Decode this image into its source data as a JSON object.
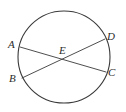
{
  "figure": {
    "type": "geometry-diagram",
    "background_color": "#ffffff",
    "stroke_color": "#3a3a3a",
    "label_color": "#2b2b2b",
    "canvas": {
      "width": 126,
      "height": 112
    },
    "circle": {
      "name": "circle",
      "cx": 64,
      "cy": 57,
      "r": 46,
      "stroke_width": 1.1
    },
    "chords": [
      {
        "name": "chord-a-c",
        "from": "A",
        "to": "C",
        "x1": 20,
        "y1": 47,
        "x2": 106,
        "y2": 72,
        "stroke_width": 0.9
      },
      {
        "name": "chord-b-d",
        "from": "B",
        "to": "D",
        "x1": 22,
        "y1": 78,
        "x2": 105,
        "y2": 39,
        "stroke_width": 0.9
      }
    ],
    "points": [
      {
        "id": "A",
        "label": "A",
        "x": 20,
        "y": 47,
        "position": "left-upper",
        "on_circle": true
      },
      {
        "id": "B",
        "label": "B",
        "x": 22,
        "y": 78,
        "position": "left-lower",
        "on_circle": true
      },
      {
        "id": "C",
        "label": "C",
        "x": 106,
        "y": 72,
        "position": "right-lower",
        "on_circle": true
      },
      {
        "id": "D",
        "label": "D",
        "x": 105,
        "y": 39,
        "position": "right-upper",
        "on_circle": true
      },
      {
        "id": "E",
        "label": "E",
        "x": 64,
        "y": 59,
        "position": "center",
        "on_circle": false
      }
    ]
  }
}
